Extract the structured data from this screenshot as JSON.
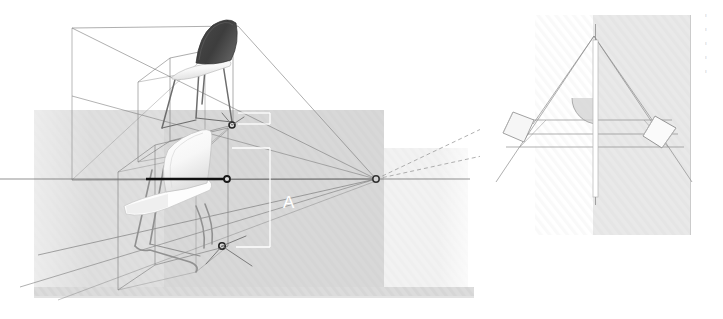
{
  "figure": {
    "background_color": "#ffffff",
    "width": 723,
    "height": 319
  },
  "left_panel": {
    "name": "perspective-view",
    "ground_band_color": "#cfcfcf",
    "floor_plane_color": "#e8e8e8",
    "base_strip_color": "#b4b4b4",
    "construction_line_color": "#6e6e6e",
    "dimension_line_color": "#ffffff",
    "dimension_label": "A",
    "horizon_line_color": "#3a3a3a",
    "objects": [
      {
        "name": "chair-upper",
        "finish": "dark",
        "seat_color": "#e6e6e6",
        "back_color": "#3f3f3f",
        "frame_color": "#5a5a5a"
      },
      {
        "name": "chair-lower",
        "finish": "light",
        "seat_color": "#fbfbfb",
        "back_color": "#f4f4f4",
        "frame_color": "#8a8a8a"
      }
    ],
    "nodes": [
      {
        "name": "node-upper",
        "x": 232,
        "y": 125
      },
      {
        "name": "node-middle",
        "x": 227,
        "y": 179
      },
      {
        "name": "node-lower",
        "x": 222,
        "y": 246
      },
      {
        "name": "vanishing-point",
        "x": 376,
        "y": 179
      }
    ]
  },
  "right_panel": {
    "name": "plan-view-detail",
    "card_color": "#fdfdfd",
    "shade_color": "#ececec",
    "axis_color": "#ffffff",
    "arc_color": "#d0d0d0",
    "outline_color": "#8e8e8e"
  },
  "margin_notes": {
    "lines": [
      "≡",
      "≡",
      "≡",
      "≡",
      "≡"
    ]
  }
}
